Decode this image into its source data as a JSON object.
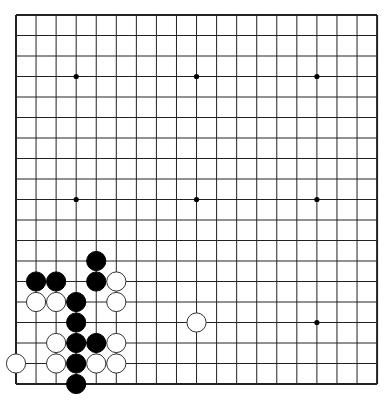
{
  "board": {
    "size": 19,
    "origin_x": 16,
    "origin_y": 15,
    "step_x": 20.06,
    "step_y": 20.5,
    "line_color": "#222222",
    "border_width": 2,
    "line_width": 1,
    "background": "#ffffff",
    "hoshi": [
      [
        3,
        3
      ],
      [
        9,
        3
      ],
      [
        15,
        3
      ],
      [
        3,
        9
      ],
      [
        9,
        9
      ],
      [
        15,
        9
      ],
      [
        3,
        15
      ],
      [
        9,
        15
      ],
      [
        15,
        15
      ]
    ],
    "hoshi_visible": [
      [
        3,
        3
      ],
      [
        9,
        3
      ],
      [
        15,
        3
      ],
      [
        3,
        9
      ],
      [
        9,
        9
      ],
      [
        15,
        9
      ],
      [
        15,
        15
      ]
    ]
  },
  "stones": [
    {
      "color": "black",
      "col": 4,
      "row": 12
    },
    {
      "color": "black",
      "col": 1,
      "row": 13
    },
    {
      "color": "black",
      "col": 2,
      "row": 13
    },
    {
      "color": "black",
      "col": 4,
      "row": 13
    },
    {
      "color": "white",
      "col": 5,
      "row": 13
    },
    {
      "color": "white",
      "col": 1,
      "row": 14
    },
    {
      "color": "white",
      "col": 2,
      "row": 14
    },
    {
      "color": "black",
      "col": 3,
      "row": 14
    },
    {
      "color": "white",
      "col": 5,
      "row": 14
    },
    {
      "color": "black",
      "col": 3,
      "row": 15
    },
    {
      "color": "white",
      "col": 9,
      "row": 15
    },
    {
      "color": "white",
      "col": 2,
      "row": 16
    },
    {
      "color": "black",
      "col": 3,
      "row": 16
    },
    {
      "color": "black",
      "col": 4,
      "row": 16
    },
    {
      "color": "white",
      "col": 5,
      "row": 16
    },
    {
      "color": "white",
      "col": 0,
      "row": 17
    },
    {
      "color": "white",
      "col": 2,
      "row": 17
    },
    {
      "color": "black",
      "col": 3,
      "row": 17
    },
    {
      "color": "white",
      "col": 4,
      "row": 17
    },
    {
      "color": "white",
      "col": 5,
      "row": 17
    },
    {
      "color": "black",
      "col": 3,
      "row": 18
    }
  ],
  "colors": {
    "black_stone": "#000000",
    "white_stone": "#ffffff",
    "stone_outline": "#333333"
  }
}
